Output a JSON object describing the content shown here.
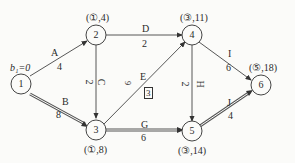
{
  "diagram": {
    "type": "activity-on-arrow network",
    "start_label": "b₁=0",
    "nodes": [
      {
        "id": "1",
        "label": "1",
        "annotation": ""
      },
      {
        "id": "2",
        "label": "2",
        "annotation": "(①,4)"
      },
      {
        "id": "3",
        "label": "3",
        "annotation": "(①,8)"
      },
      {
        "id": "4",
        "label": "4",
        "annotation": "(③,11)"
      },
      {
        "id": "5",
        "label": "5",
        "annotation": "(③,14)"
      },
      {
        "id": "6",
        "label": "6",
        "annotation": "(⑤,18)"
      }
    ],
    "edges": [
      {
        "name": "A",
        "from": "1",
        "to": "2",
        "duration": "4",
        "critical": false
      },
      {
        "name": "B",
        "from": "1",
        "to": "3",
        "duration": "8",
        "critical": true
      },
      {
        "name": "C",
        "from": "2",
        "to": "3",
        "duration": "2",
        "critical": false
      },
      {
        "name": "D",
        "from": "2",
        "to": "4",
        "duration": "2",
        "critical": false
      },
      {
        "name": "E",
        "from": "3",
        "to": "4",
        "duration": "3",
        "critical": false,
        "boxed": true
      },
      {
        "name": "G",
        "from": "3",
        "to": "5",
        "duration": "6",
        "critical": true
      },
      {
        "name": "H",
        "from": "4",
        "to": "5",
        "duration": "2",
        "critical": false
      },
      {
        "name": "I",
        "from": "4",
        "to": "6",
        "duration": "6",
        "critical": false
      },
      {
        "name": "J",
        "from": "5",
        "to": "6",
        "duration": "4",
        "critical": true
      }
    ],
    "misc_mark": "9"
  }
}
